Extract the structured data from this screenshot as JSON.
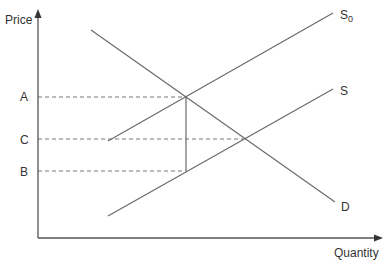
{
  "axes": {
    "y_label": "Price",
    "x_label": "Quantity"
  },
  "price_levels": [
    {
      "label": "A",
      "y": 97
    },
    {
      "label": "C",
      "y": 139
    },
    {
      "label": "B",
      "y": 171
    }
  ],
  "curves": {
    "S0": {
      "label": "S",
      "subscript": "0",
      "from": [
        108,
        141
      ],
      "to": [
        333,
        13
      ]
    },
    "S": {
      "label": "S",
      "from": [
        108,
        216
      ],
      "to": [
        333,
        89
      ]
    },
    "D": {
      "label": "D",
      "from": [
        91,
        30
      ],
      "to": [
        335,
        202
      ]
    }
  },
  "colors": {
    "line": "#6a6a6a",
    "axis": "#555555",
    "text": "#333333"
  }
}
